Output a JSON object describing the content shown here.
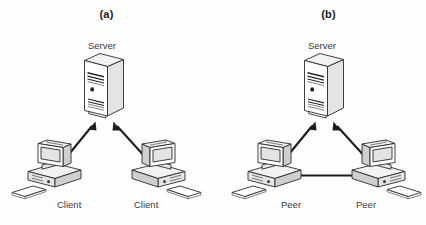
{
  "figure": {
    "width": 426,
    "height": 225,
    "background": "#fefefe",
    "line_color": "#2b2b2b",
    "arrow_color": "#1d1d1d",
    "label_color": "#3a3a3a",
    "caption_color": "#1a1a1a"
  },
  "panels": [
    {
      "id": "a",
      "caption": "(a)",
      "topology": "client-server",
      "nodes": [
        {
          "role": "server",
          "label": "Server",
          "icon": "server-tower-icon"
        },
        {
          "role": "client-left",
          "label": "Client",
          "icon": "desktop-computer-icon"
        },
        {
          "role": "client-right",
          "label": "Client",
          "icon": "desktop-computer-icon"
        }
      ],
      "links": [
        {
          "from": "server",
          "to": "client-left",
          "style": "double-headed-arrow"
        },
        {
          "from": "server",
          "to": "client-right",
          "style": "double-headed-arrow"
        }
      ]
    },
    {
      "id": "b",
      "caption": "(b)",
      "topology": "peer-to-peer-with-server",
      "nodes": [
        {
          "role": "server",
          "label": "Server",
          "icon": "server-tower-icon"
        },
        {
          "role": "peer-left",
          "label": "Peer",
          "icon": "desktop-computer-icon"
        },
        {
          "role": "peer-right",
          "label": "Peer",
          "icon": "desktop-computer-icon"
        }
      ],
      "links": [
        {
          "from": "server",
          "to": "peer-left",
          "style": "double-headed-arrow"
        },
        {
          "from": "server",
          "to": "peer-right",
          "style": "double-headed-arrow"
        },
        {
          "from": "peer-left",
          "to": "peer-right",
          "style": "double-headed-arrow"
        }
      ]
    }
  ]
}
